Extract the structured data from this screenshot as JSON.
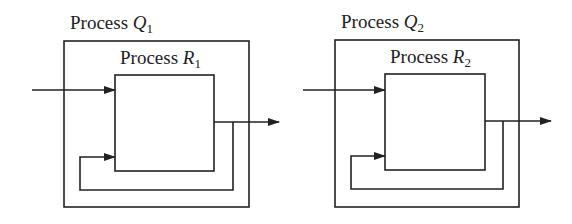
{
  "diagrams": [
    {
      "outer": {
        "label_prefix": "Process ",
        "var": "Q",
        "sub": "1"
      },
      "inner": {
        "label_prefix": "Process ",
        "var": "R",
        "sub": "1"
      }
    },
    {
      "outer": {
        "label_prefix": "Process ",
        "var": "Q",
        "sub": "2"
      },
      "inner": {
        "label_prefix": "Process ",
        "var": "R",
        "sub": "2"
      }
    }
  ],
  "colors": {
    "stroke": "#222222",
    "background": "#ffffff"
  }
}
